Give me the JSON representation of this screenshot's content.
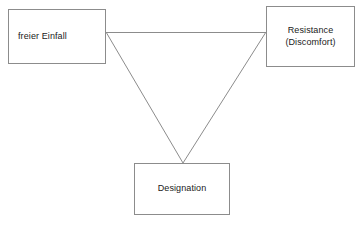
{
  "diagram": {
    "type": "triangle-relationship-diagram",
    "background_color": "#ffffff",
    "line_color": "#8c8c8c",
    "border_color": "#8c8c8c",
    "text_color": "#1a1a1a",
    "nodes": [
      {
        "id": "freier-einfall",
        "label": "freier Einfall",
        "position": "top-left"
      },
      {
        "id": "resistance",
        "label": "Resistance\n(Discomfort)",
        "position": "top-right"
      },
      {
        "id": "designation",
        "label": "Designation",
        "position": "bottom-center"
      }
    ],
    "edges": [
      {
        "id": "freier-einfall-to-resistance",
        "from": "freier-einfall",
        "to": "resistance",
        "style": "plain-line"
      },
      {
        "id": "freier-einfall-to-designation",
        "from": "freier-einfall",
        "to": "designation",
        "style": "plain-line"
      },
      {
        "id": "resistance-to-designation",
        "from": "resistance",
        "to": "designation",
        "style": "plain-line"
      }
    ]
  }
}
